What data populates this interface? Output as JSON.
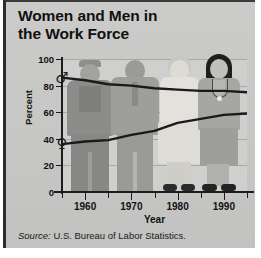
{
  "chart_data": {
    "type": "line",
    "title": "Women and Men in the Work Force",
    "title_line1": "Women and Men in",
    "title_line2": "the Work Force",
    "xlabel": "Year",
    "ylabel": "Percent",
    "xlim": [
      1955,
      1995
    ],
    "ylim": [
      0,
      100
    ],
    "grid": true,
    "legend_position": "none",
    "x_ticks": [
      1960,
      1970,
      1980,
      1990
    ],
    "x_minor_ticks": [
      1955,
      1965,
      1975,
      1985,
      1995
    ],
    "y_ticks": [
      0,
      20,
      40,
      60,
      80,
      100
    ],
    "x": [
      1955,
      1960,
      1965,
      1970,
      1975,
      1980,
      1985,
      1990,
      1995
    ],
    "series": [
      {
        "name": "Men",
        "marker": "male-symbol",
        "marker_glyph": "♂",
        "start_value": 86,
        "values": [
          86,
          84,
          81,
          80,
          78,
          77,
          76,
          76,
          75
        ]
      },
      {
        "name": "Women",
        "marker": "female-symbol",
        "marker_glyph": "♀",
        "start_value": 37,
        "values": [
          36,
          38,
          39,
          43,
          46,
          52,
          55,
          58,
          59
        ]
      }
    ],
    "source_label": "Source:",
    "source_text": "U.S. Bureau of Labor Statistics.",
    "colors": {
      "line": "#1a1a1a",
      "background": "#c8c8c6",
      "plot_background": "#cfcfcd",
      "gridline": "#a8a8a6",
      "axis": "#1c1c1c",
      "text": "#111111"
    }
  },
  "figures": [
    {
      "name": "man-in-overalls",
      "era": "1960"
    },
    {
      "name": "man-in-suit",
      "era": "1970"
    },
    {
      "name": "woman-in-uniform",
      "era": "1980"
    },
    {
      "name": "businesswoman",
      "era": "1990"
    }
  ]
}
